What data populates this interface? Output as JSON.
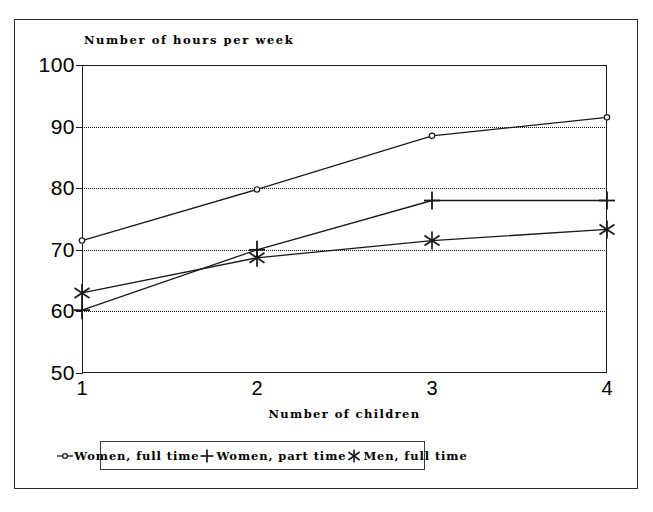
{
  "chart_data": {
    "type": "line",
    "title": "Number of hours per week",
    "xlabel": "Number of children",
    "ylabel": "",
    "x": [
      1,
      2,
      3,
      4
    ],
    "categories": [
      "1",
      "2",
      "3",
      "4"
    ],
    "xtick_labels": [
      "1",
      "2",
      "3",
      "4"
    ],
    "ytick_labels": [
      "100",
      "90",
      "80",
      "70",
      "60",
      "50"
    ],
    "yticks": [
      100,
      90,
      80,
      70,
      60,
      50
    ],
    "ylim": [
      50,
      100
    ],
    "xlim": [
      1,
      4
    ],
    "grid": "horizontal-dotted",
    "legend_position": "bottom-center",
    "series": [
      {
        "name": "Women, full time",
        "marker": "circle",
        "values": [
          71.5,
          79.8,
          88.5,
          91.5
        ]
      },
      {
        "name": "Women, part time",
        "marker": "plus",
        "values": [
          60.2,
          70.0,
          78.0,
          78.0
        ]
      },
      {
        "name": "Men, full time",
        "marker": "asterisk",
        "values": [
          63.0,
          68.7,
          71.5,
          73.3
        ]
      }
    ]
  },
  "legend": {
    "items": [
      {
        "label": "Women, full time",
        "marker": "circle-marker-icon"
      },
      {
        "label": "Women, part time",
        "marker": "plus-marker-icon"
      },
      {
        "label": "Men, full time",
        "marker": "asterisk-marker-icon"
      }
    ]
  },
  "colors": {
    "line": "#1a1a1a",
    "grid": "#111111",
    "frame": "#2a2a2a",
    "background": "#ffffff"
  }
}
